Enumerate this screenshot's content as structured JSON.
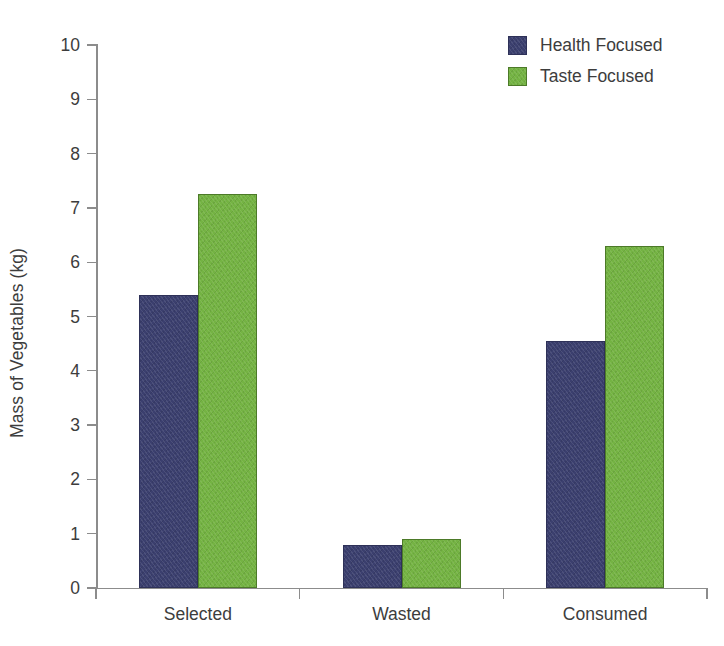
{
  "chart_data": {
    "type": "bar",
    "title": "",
    "xlabel": "",
    "ylabel": "Mass of Vegetables (kg)",
    "categories": [
      "Selected",
      "Wasted",
      "Consumed"
    ],
    "series": [
      {
        "name": "Health Focused",
        "color": "#3b3f6e",
        "values": [
          5.4,
          0.8,
          4.55
        ]
      },
      {
        "name": "Taste Focused",
        "color": "#74b343",
        "values": [
          7.25,
          0.9,
          6.3
        ]
      }
    ],
    "ylim": [
      0,
      10
    ],
    "ytick_step": 1,
    "ytick_labels": [
      "0",
      "1",
      "2",
      "3",
      "4",
      "5",
      "6",
      "7",
      "8",
      "9",
      "10"
    ],
    "grid": false,
    "legend_position": "top-right",
    "axis_color": "#8c8c8c",
    "text_color": "#3d3d3d",
    "background": "#ffffff"
  }
}
